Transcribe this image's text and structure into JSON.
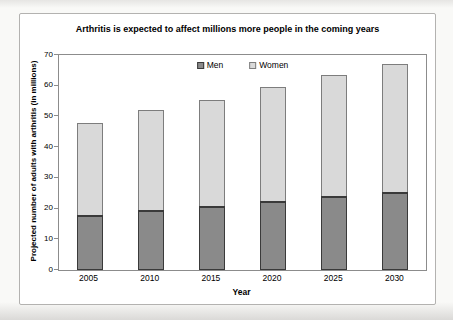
{
  "chart_data": {
    "type": "bar",
    "stacked": true,
    "title": "Arthritis is expected to affect millions more people in the coming years",
    "xlabel": "Year",
    "ylabel": "Projected number of adults with arthritis (in millions)",
    "categories": [
      "2005",
      "2010",
      "2015",
      "2020",
      "2025",
      "2030"
    ],
    "series": [
      {
        "name": "Men",
        "values": [
          18,
          19.5,
          21,
          22.5,
          24,
          25.5
        ],
        "fill": "#8a8a8a",
        "border": "#3a3a3a"
      },
      {
        "name": "Women",
        "values": [
          30,
          32.5,
          34.5,
          37,
          39.5,
          41.5
        ],
        "fill": "#d9d9d9",
        "border": "#7d7d7d"
      }
    ],
    "totals": [
      48,
      52,
      55.5,
      59.5,
      63.5,
      67
    ],
    "ylim": [
      0,
      70
    ],
    "yticks": [
      0,
      10,
      20,
      30,
      40,
      50,
      60,
      70
    ],
    "grid": false,
    "legend_position": "top-center",
    "plot_background": "#ffffff",
    "frame_color": "#8c8c8c"
  }
}
